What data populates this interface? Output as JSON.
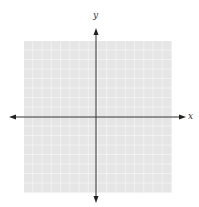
{
  "diagram": {
    "type": "blank coordinate plane",
    "x_axis_label": "x",
    "y_axis_label": "y",
    "grid": {
      "columns": 16,
      "rows": 16,
      "fill": "#e6e6e6",
      "line_color": "#ffffff"
    },
    "axis_color": "#333333"
  }
}
